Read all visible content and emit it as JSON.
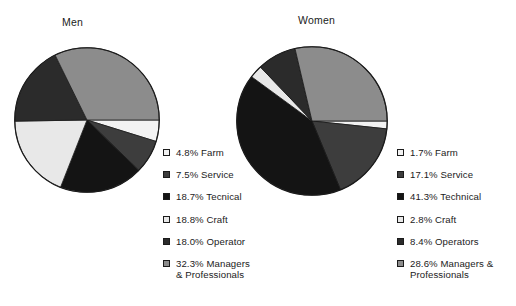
{
  "figure": {
    "background": "#ffffff",
    "outline_color": "#1b1b1b"
  },
  "palette": {
    "farm": "#f2f2f2",
    "service": "#3d3d3d",
    "technical": "#141414",
    "craft": "#e8e8e8",
    "operator": "#2b2b2b",
    "managers": "#8c8c8c"
  },
  "panels": {
    "men": {
      "title": "Men",
      "legend": [
        {
          "swatch": "farm",
          "color": "#f2f2f2",
          "label": "4.8% Farm"
        },
        {
          "swatch": "service",
          "color": "#3d3d3d",
          "label": "7.5% Service"
        },
        {
          "swatch": "technical",
          "color": "#141414",
          "label": "18.7% Tecnical"
        },
        {
          "swatch": "craft",
          "color": "#e8e8e8",
          "label": "18.8% Craft"
        },
        {
          "swatch": "operator",
          "color": "#2b2b2b",
          "label": "18.0% Operator"
        },
        {
          "swatch": "managers",
          "color": "#8c8c8c",
          "label": "32.3% Managers & Professionals"
        }
      ]
    },
    "women": {
      "title": "Women",
      "legend": [
        {
          "swatch": "farm",
          "color": "#f2f2f2",
          "label": "1.7% Farm"
        },
        {
          "swatch": "service",
          "color": "#3d3d3d",
          "label": "17.1% Service"
        },
        {
          "swatch": "technical",
          "color": "#141414",
          "label": "41.3% Technical"
        },
        {
          "swatch": "craft",
          "color": "#e8e8e8",
          "label": "2.8% Craft"
        },
        {
          "swatch": "operator",
          "color": "#2b2b2b",
          "label": "8.4% Operators"
        },
        {
          "swatch": "managers",
          "color": "#8c8c8c",
          "label": "28.6% Managers & Professionals"
        }
      ]
    }
  },
  "chart_data": [
    {
      "type": "pie",
      "title": "Men",
      "labels": [
        "Farm",
        "Service",
        "Tecnical",
        "Craft",
        "Operator",
        "Managers & Professionals"
      ],
      "values": [
        4.8,
        7.5,
        18.7,
        18.8,
        18.0,
        32.3
      ],
      "unit": "percent",
      "start_angle": 0,
      "direction": "clockwise",
      "colors": [
        "#f2f2f2",
        "#3d3d3d",
        "#141414",
        "#e8e8e8",
        "#2b2b2b",
        "#8c8c8c"
      ],
      "legend_position": "right",
      "grid": false
    },
    {
      "type": "pie",
      "title": "Women",
      "labels": [
        "Farm",
        "Service",
        "Technical",
        "Craft",
        "Operators",
        "Managers & Professionals"
      ],
      "values": [
        1.7,
        17.1,
        41.3,
        2.8,
        8.4,
        28.6
      ],
      "unit": "percent",
      "start_angle": 0,
      "direction": "clockwise",
      "colors": [
        "#f2f2f2",
        "#3d3d3d",
        "#141414",
        "#e8e8e8",
        "#2b2b2b",
        "#8c8c8c"
      ],
      "legend_position": "right",
      "grid": false
    }
  ]
}
